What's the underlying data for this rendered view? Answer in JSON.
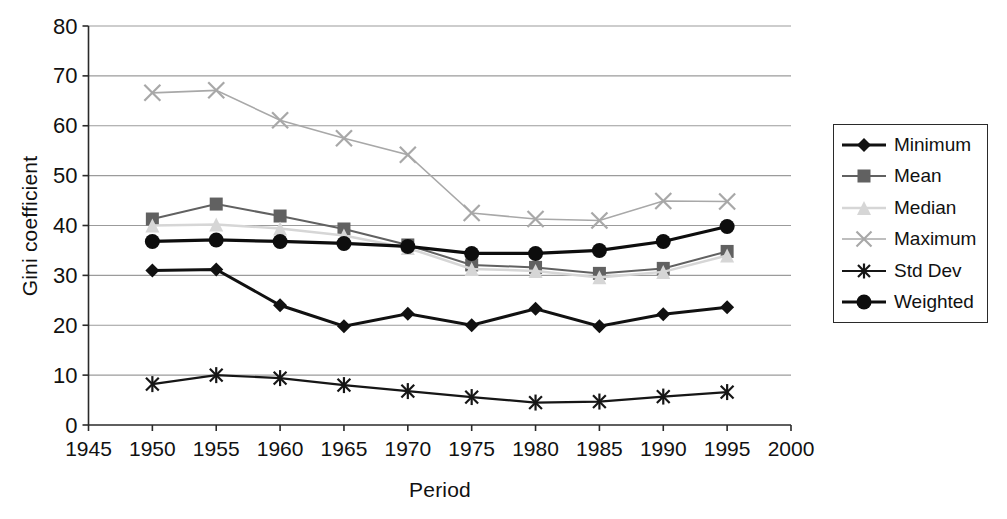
{
  "chart_data": {
    "type": "line",
    "title": "",
    "xlabel": "Period",
    "ylabel": "Gini coefficient",
    "xlim": [
      1945,
      2000
    ],
    "ylim": [
      0,
      80
    ],
    "xticks": [
      1945,
      1950,
      1955,
      1960,
      1965,
      1970,
      1975,
      1980,
      1985,
      1990,
      1995,
      2000
    ],
    "yticks": [
      0,
      10,
      20,
      30,
      40,
      50,
      60,
      70,
      80
    ],
    "grid": "horizontal",
    "legend_position": "right",
    "x": [
      1950,
      1955,
      1960,
      1965,
      1970,
      1975,
      1980,
      1985,
      1990,
      1995
    ],
    "series": [
      {
        "name": "Minimum",
        "marker": "diamond",
        "color": "#111111",
        "line_width": 3.0,
        "marker_size": 7,
        "values": [
          31.0,
          31.2,
          24.0,
          19.8,
          22.3,
          20.0,
          23.3,
          19.8,
          22.2,
          23.6
        ]
      },
      {
        "name": "Mean",
        "marker": "square",
        "color": "#616161",
        "line_width": 2.0,
        "marker_size": 6.5,
        "values": [
          41.3,
          44.3,
          41.9,
          39.3,
          36.1,
          32.1,
          31.6,
          30.4,
          31.4,
          34.8
        ]
      },
      {
        "name": "Median",
        "marker": "triangle",
        "color": "#d6d6d6",
        "line_width": 2.5,
        "marker_size": 7,
        "values": [
          40.0,
          40.2,
          39.4,
          38.0,
          35.5,
          31.3,
          30.9,
          29.6,
          30.7,
          34.0
        ]
      },
      {
        "name": "Maximum",
        "marker": "x",
        "color": "#a8a8a8",
        "line_width": 1.6,
        "marker_size": 8,
        "values": [
          66.6,
          67.1,
          61.1,
          57.5,
          54.2,
          42.5,
          41.3,
          41.0,
          44.9,
          44.8
        ]
      },
      {
        "name": "Std Dev",
        "marker": "asterisk",
        "color": "#161616",
        "line_width": 2.2,
        "marker_size": 8,
        "values": [
          8.2,
          10.0,
          9.4,
          8.0,
          6.8,
          5.6,
          4.5,
          4.7,
          5.7,
          6.6
        ]
      },
      {
        "name": "Weighted",
        "marker": "circle",
        "color": "#0d0d0d",
        "line_width": 3.2,
        "marker_size": 7.5,
        "values": [
          36.8,
          37.1,
          36.8,
          36.4,
          35.8,
          34.4,
          34.4,
          35.0,
          36.8,
          39.8
        ]
      }
    ]
  },
  "colors": {
    "background": "#ffffff",
    "gridline": "#9b9b9b",
    "axis": "#2a2a2a",
    "text": "#111111",
    "legend_border": "#2a2a2a"
  }
}
